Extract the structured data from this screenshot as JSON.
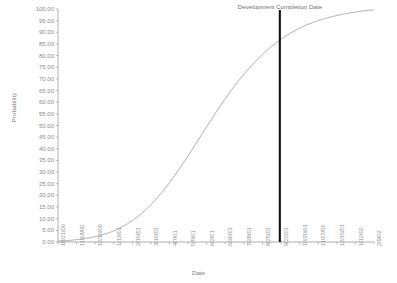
{
  "chart_data": {
    "type": "line",
    "title": "",
    "xlabel": "Date",
    "ylabel": "Probability",
    "ylim": [
      0,
      100
    ],
    "ytick_step": 5,
    "grid": false,
    "legend": "none",
    "yticks": [
      "100.00",
      "95.00",
      "90.00",
      "85.00",
      "80.00",
      "75.00",
      "70.00",
      "65.00",
      "60.00",
      "55.00",
      "50.00",
      "45.00",
      "40.00",
      "35.00",
      "30.00",
      "25.00",
      "20.00",
      "15.00",
      "10.00",
      "5.00",
      "0.00"
    ],
    "categories": [
      "10/21/00",
      "11/18/00",
      "12/16/00",
      "1/13/01",
      "2/10/01",
      "3/10/01",
      "4/7/01",
      "5/5/01",
      "6/2/01",
      "6/30/01",
      "7/28/01",
      "8/25/01",
      "9/22/01",
      "10/20/01",
      "11/17/01",
      "12/15/01",
      "1/12/02",
      "2/9/02"
    ],
    "x": [
      0.0,
      0.0588,
      0.1176,
      0.1765,
      0.2353,
      0.2941,
      0.3529,
      0.4118,
      0.4706,
      0.5294,
      0.5882,
      0.6471,
      0.7059,
      0.7647,
      0.8235,
      0.8824,
      0.9412,
      1.0
    ],
    "values": [
      0.4,
      1.0,
      2.3,
      4.8,
      9.2,
      16.0,
      25.5,
      37.0,
      49.5,
      61.5,
      72.0,
      80.5,
      87.0,
      91.8,
      95.0,
      97.2,
      98.7,
      99.6
    ],
    "annotations": [
      {
        "text": "Development Completion Date",
        "type": "vertical-line",
        "x_value": "8/4/01",
        "x_fraction": 0.702,
        "y_at_line": 82.0,
        "color": "#111111"
      }
    ],
    "series_color": "#9a9a9a",
    "axis_color": "#9d9d9d"
  }
}
